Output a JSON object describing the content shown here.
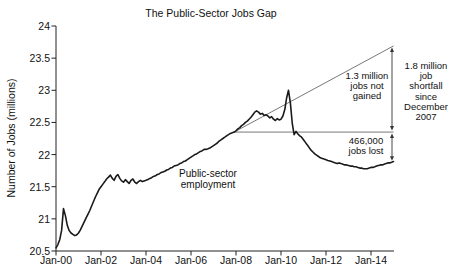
{
  "title": "The Public-Sector Jobs Gap",
  "y_axis_label": "Number of Jobs (millions)",
  "annotations": {
    "series_label": "Public-sector\nemployment",
    "not_gained": "1.3 million\njobs not\ngained",
    "shortfall": "1.8 million\njob\nshortfall\nsince\nDecember\n2007",
    "jobs_lost": "466,000\njobs lost"
  },
  "colors": {
    "line": "#1a1a1a",
    "axis": "#222222",
    "annotation_line": "#555555",
    "arrow": "#333333",
    "text": "#111111",
    "background": "#ffffff"
  },
  "chart_data": {
    "type": "line",
    "title": "The Public-Sector Jobs Gap",
    "xlabel": "",
    "ylabel": "Number of Jobs (millions)",
    "ylim": [
      20.5,
      24
    ],
    "y_ticks": [
      24,
      23.5,
      23,
      22.5,
      22,
      21.5,
      21,
      20.5
    ],
    "x_tick_labels": [
      "Jan-00",
      "Jan-02",
      "Jan-04",
      "Jan-06",
      "Jan-08",
      "Jan-10",
      "Jan-12",
      "Jan-14"
    ],
    "x_start": "2000-01",
    "x_end": "2015-01",
    "frequency": "monthly",
    "grid": false,
    "legend": "none",
    "series": [
      {
        "name": "Public-sector employment",
        "values": [
          20.55,
          20.6,
          20.68,
          20.82,
          21.16,
          21.05,
          20.9,
          20.82,
          20.78,
          20.76,
          20.74,
          20.75,
          20.78,
          20.83,
          20.89,
          20.95,
          21.01,
          21.07,
          21.13,
          21.2,
          21.27,
          21.34,
          21.4,
          21.46,
          21.5,
          21.54,
          21.58,
          21.62,
          21.65,
          21.68,
          21.63,
          21.6,
          21.66,
          21.69,
          21.63,
          21.59,
          21.57,
          21.61,
          21.58,
          21.55,
          21.6,
          21.62,
          21.57,
          21.55,
          21.58,
          21.6,
          21.58,
          21.59,
          21.6,
          21.61,
          21.63,
          21.64,
          21.66,
          21.67,
          21.69,
          21.7,
          21.72,
          21.73,
          21.74,
          21.76,
          21.77,
          21.79,
          21.8,
          21.82,
          21.83,
          21.84,
          21.86,
          21.87,
          21.89,
          21.9,
          21.92,
          21.94,
          21.96,
          21.98,
          22.0,
          22.01,
          22.03,
          22.05,
          22.06,
          22.08,
          22.08,
          22.09,
          22.1,
          22.12,
          22.14,
          22.16,
          22.18,
          22.21,
          22.23,
          22.25,
          22.27,
          22.29,
          22.31,
          22.33,
          22.34,
          22.35,
          22.37,
          22.4,
          22.42,
          22.45,
          22.47,
          22.5,
          22.52,
          22.55,
          22.58,
          22.62,
          22.66,
          22.68,
          22.66,
          22.63,
          22.64,
          22.61,
          22.62,
          22.6,
          22.57,
          22.59,
          22.55,
          22.53,
          22.56,
          22.54,
          22.55,
          22.6,
          22.7,
          22.88,
          23.0,
          22.8,
          22.48,
          22.31,
          22.36,
          22.32,
          22.29,
          22.27,
          22.23,
          22.19,
          22.15,
          22.11,
          22.07,
          22.04,
          22.01,
          21.99,
          21.97,
          21.95,
          21.94,
          21.93,
          21.92,
          21.91,
          21.9,
          21.89,
          21.88,
          21.87,
          21.86,
          21.87,
          21.86,
          21.85,
          21.84,
          21.84,
          21.83,
          21.82,
          21.82,
          21.81,
          21.81,
          21.8,
          21.79,
          21.79,
          21.78,
          21.78,
          21.78,
          21.79,
          21.8,
          21.8,
          21.81,
          21.82,
          21.83,
          21.84,
          21.84,
          21.85,
          21.86,
          21.87,
          21.87,
          21.88,
          21.89
        ]
      }
    ],
    "reference": {
      "december_2007": {
        "date": "2007-12",
        "value": 22.35
      },
      "horizontal_line": {
        "from": "2007-12",
        "to": "2015-01",
        "value": 22.35
      },
      "projection_line": {
        "from": {
          "date": "2007-12",
          "value": 22.35
        },
        "to": {
          "date": "2015-01",
          "value": 23.69
        }
      },
      "jobs_not_gained_millions": 1.3,
      "jobs_lost_count": 466000,
      "total_shortfall_millions": 1.8
    }
  }
}
